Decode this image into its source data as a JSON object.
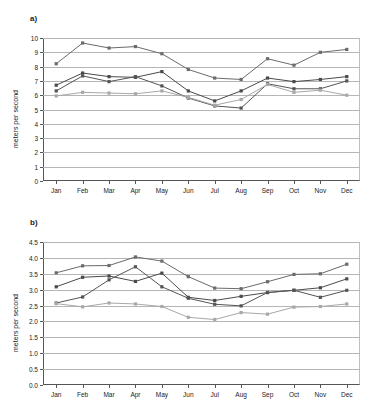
{
  "figure": {
    "panel_a_label": "a)",
    "panel_b_label": "b)"
  },
  "chart_data": [
    {
      "id": "panel-a",
      "type": "line",
      "title": "a)",
      "xlabel": "",
      "ylabel": "meters per second",
      "categories": [
        "Jan",
        "Feb",
        "Mar",
        "Apr",
        "May",
        "Jun",
        "Jul",
        "Aug",
        "Sep",
        "Oct",
        "Nov",
        "Dec"
      ],
      "ylim": [
        0,
        10
      ],
      "ytick_step": 1,
      "yticks": [
        "0",
        "1",
        "2",
        "3",
        "4",
        "5",
        "6",
        "7",
        "8",
        "9",
        "10"
      ],
      "grid": true,
      "legend": "none",
      "series": [
        {
          "name": "series-1",
          "color": "#6b6b6b",
          "marker": "square",
          "values": [
            8.2,
            9.65,
            9.3,
            9.4,
            8.9,
            7.8,
            7.2,
            7.1,
            8.55,
            8.1,
            9.0,
            9.2
          ]
        },
        {
          "name": "series-2",
          "color": "#4a4a4a",
          "marker": "square",
          "values": [
            6.7,
            7.55,
            7.3,
            7.25,
            7.65,
            6.3,
            5.6,
            6.3,
            7.2,
            6.95,
            7.1,
            7.3
          ]
        },
        {
          "name": "series-3",
          "color": "#555555",
          "marker": "square",
          "values": [
            6.3,
            7.35,
            6.95,
            7.3,
            6.65,
            5.8,
            5.25,
            5.1,
            6.8,
            6.45,
            6.45,
            7.0
          ]
        },
        {
          "name": "series-4",
          "color": "#a8a8a8",
          "marker": "square",
          "values": [
            5.95,
            6.2,
            6.15,
            6.1,
            6.3,
            5.85,
            5.3,
            5.7,
            6.75,
            6.2,
            6.35,
            6.0
          ]
        }
      ]
    },
    {
      "id": "panel-b",
      "type": "line",
      "title": "b)",
      "xlabel": "",
      "ylabel": "meters per second",
      "categories": [
        "Jan",
        "Feb",
        "Mar",
        "Apr",
        "May",
        "Jun",
        "Jul",
        "Aug",
        "Sep",
        "Oct",
        "Nov",
        "Dec"
      ],
      "ylim": [
        0,
        4.5
      ],
      "ytick_step": 0.5,
      "yticks": [
        "0.0",
        "0.5",
        "1.0",
        "1.5",
        "2.0",
        "2.5",
        "3.0",
        "3.5",
        "4.0",
        "4.5"
      ],
      "grid": true,
      "legend": "none",
      "series": [
        {
          "name": "series-1",
          "color": "#6b6b6b",
          "marker": "square",
          "values": [
            3.53,
            3.75,
            3.76,
            4.03,
            3.9,
            3.41,
            3.05,
            3.03,
            3.25,
            3.48,
            3.5,
            3.8
          ]
        },
        {
          "name": "series-2",
          "color": "#4a4a4a",
          "marker": "square",
          "values": [
            3.09,
            3.39,
            3.43,
            3.26,
            3.52,
            2.76,
            2.66,
            2.79,
            2.91,
            2.98,
            3.06,
            3.34
          ]
        },
        {
          "name": "series-3",
          "color": "#555555",
          "marker": "square",
          "values": [
            2.58,
            2.77,
            3.31,
            3.72,
            3.09,
            2.73,
            2.54,
            2.49,
            2.91,
            2.98,
            2.76,
            2.98
          ]
        },
        {
          "name": "series-4",
          "color": "#a8a8a8",
          "marker": "square",
          "values": [
            2.56,
            2.46,
            2.58,
            2.55,
            2.47,
            2.13,
            2.06,
            2.28,
            2.23,
            2.45,
            2.47,
            2.55
          ]
        }
      ]
    }
  ]
}
